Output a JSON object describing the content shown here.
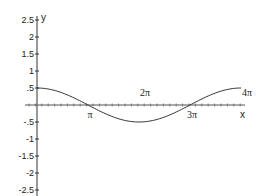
{
  "chart_data": {
    "type": "line",
    "title": "",
    "xlabel": "x",
    "ylabel": "y",
    "xlim": [
      0,
      12.566
    ],
    "ylim": [
      -2.5,
      2.5
    ],
    "grid": false,
    "legend": null,
    "x_tick_labels": [
      "π",
      "2π",
      "3π",
      "4π"
    ],
    "x_tick_values": [
      3.1416,
      6.2832,
      9.4248,
      12.5664
    ],
    "y_tick_labels": [
      "2.5",
      "2",
      "1.5",
      "1",
      ".5",
      "-.5",
      "-1",
      "-1.5",
      "-2",
      "-2.5"
    ],
    "y_tick_values": [
      2.5,
      2,
      1.5,
      1,
      0.5,
      -0.5,
      -1,
      -1.5,
      -2,
      -2.5
    ],
    "series": [
      {
        "name": "y = 0.5·cos(x/2)",
        "x": [
          0,
          1.5708,
          3.1416,
          4.7124,
          6.2832,
          7.854,
          9.4248,
          10.9956,
          12.5664
        ],
        "y": [
          0.5,
          0.354,
          0,
          -0.354,
          -0.5,
          -0.354,
          0,
          0.354,
          0.5
        ]
      }
    ]
  },
  "axes": {
    "x_label": "x",
    "y_label": "y"
  }
}
